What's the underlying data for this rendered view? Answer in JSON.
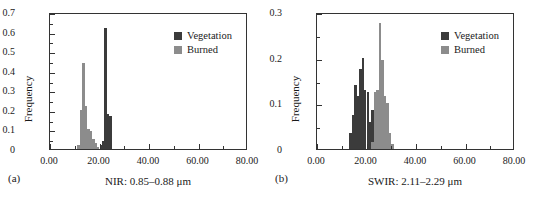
{
  "figure": {
    "background": "#ffffff",
    "colors": {
      "vegetation": "#3b3b3b",
      "burned": "#8c8c8c",
      "axis": "#333333",
      "text": "#1a1a1a"
    }
  },
  "panels": [
    {
      "id": "a",
      "panel_label": "(a)",
      "legend": [
        {
          "label": "Vegetation",
          "color": "#3b3b3b"
        },
        {
          "label": "Burned",
          "color": "#8c8c8c"
        }
      ],
      "chart_data": {
        "type": "bar",
        "title": "",
        "xlabel": "NIR: 0.85–0.88 μm",
        "ylabel": "Frequency",
        "xlim": [
          0,
          80
        ],
        "ylim": [
          0,
          0.7
        ],
        "xticks": [
          0,
          20,
          40,
          60,
          80
        ],
        "xticklabels": [
          "0.00",
          "20.00",
          "40.00",
          "60.00",
          "80.00"
        ],
        "yticks": [
          0,
          0.1,
          0.2,
          0.3,
          0.4,
          0.5,
          0.6,
          0.7
        ],
        "yticklabels": [
          "0",
          "0.1",
          "0.2",
          "0.3",
          "0.4",
          "0.5",
          "0.6",
          "0.7"
        ],
        "xminor_ticks": [
          10,
          30,
          50,
          70
        ],
        "yminor_ticks": [
          0.05,
          0.15,
          0.25,
          0.35,
          0.45,
          0.55,
          0.65
        ],
        "grid": false,
        "legend_position": "top-right",
        "bin_width": 1,
        "series": [
          {
            "name": "Burned",
            "color": "#8c8c8c",
            "x": [
              11,
              12,
              13,
              14,
              15,
              16,
              17,
              18,
              19
            ],
            "values": [
              0.02,
              0.2,
              0.44,
              0.22,
              0.1,
              0.09,
              0.05,
              0.03,
              0.01
            ]
          },
          {
            "name": "Vegetation",
            "color": "#3b3b3b",
            "x": [
              20,
              21,
              22,
              23,
              24
            ],
            "values": [
              0.02,
              0.04,
              0.62,
              0.18,
              0.17
            ]
          }
        ]
      }
    },
    {
      "id": "b",
      "panel_label": "(b)",
      "legend": [
        {
          "label": "Vegetation",
          "color": "#3b3b3b"
        },
        {
          "label": "Burned",
          "color": "#8c8c8c"
        }
      ],
      "chart_data": {
        "type": "bar",
        "title": "",
        "xlabel": "SWIR: 2.11–2.29 μm",
        "ylabel": "Frequency",
        "xlim": [
          0,
          80
        ],
        "ylim": [
          0,
          0.3
        ],
        "xticks": [
          0,
          20,
          40,
          60,
          80
        ],
        "xticklabels": [
          "0.00",
          "20.00",
          "40.00",
          "60.00",
          "80.00"
        ],
        "yticks": [
          0,
          0.1,
          0.2,
          0.3
        ],
        "yticklabels": [
          "0",
          "0.1",
          "0.2",
          "0.3"
        ],
        "xminor_ticks": [
          10,
          30,
          50,
          70
        ],
        "yminor_ticks": [
          0.05,
          0.15,
          0.25
        ],
        "grid": false,
        "legend_position": "top-right",
        "bin_width": 1,
        "series": [
          {
            "name": "Vegetation",
            "color": "#3b3b3b",
            "x": [
              13,
              14,
              15,
              16,
              17,
              18,
              19,
              20,
              21,
              22,
              23
            ],
            "values": [
              0.035,
              0.075,
              0.14,
              0.115,
              0.175,
              0.2,
              0.13,
              0.125,
              0.06,
              0.085,
              0.02
            ]
          },
          {
            "name": "Burned",
            "color": "#8c8c8c",
            "x": [
              22,
              23,
              24,
              25,
              26,
              27,
              28,
              29,
              30
            ],
            "values": [
              0.015,
              0.125,
              0.13,
              0.275,
              0.195,
              0.115,
              0.1,
              0.035,
              0.01
            ]
          }
        ]
      }
    }
  ]
}
